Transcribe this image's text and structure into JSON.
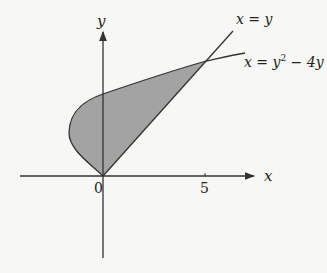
{
  "figure": {
    "type": "region between curves",
    "axes": {
      "x_label": "x",
      "y_label": "y",
      "origin_label": "0",
      "x_ticks": [
        {
          "value": 5,
          "label": "5"
        }
      ]
    },
    "curves": [
      {
        "name": "line",
        "equation_lhs": "x = y",
        "equation": "x = y"
      },
      {
        "name": "parabola",
        "equation_lhs": "x = y",
        "exponent": "2",
        "equation_rhs": " − 4y",
        "equation": "x = y² − 4y"
      }
    ],
    "shaded_region": {
      "description": "region bounded by x = y² − 4y and x = y",
      "intersection_points": [
        [
          0,
          0
        ],
        [
          5,
          5
        ]
      ],
      "fill_color": "#a3a3a3"
    },
    "colors": {
      "stroke": "#333333",
      "fill": "#a3a3a3",
      "background": "#f7f7f5"
    }
  }
}
